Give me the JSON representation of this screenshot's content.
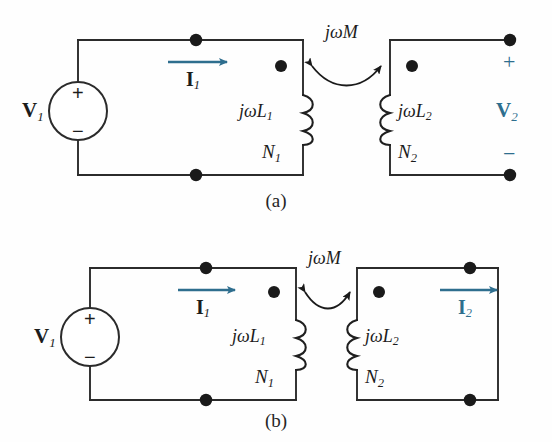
{
  "figure": {
    "colors": {
      "wire": "#2b2b2b",
      "node_dot": "#1a1a1a",
      "text_black": "#1c1c1c",
      "accent_blue": "#2E6E8E"
    },
    "panels": [
      {
        "id": "a",
        "caption": "(a)",
        "source": {
          "name": "V1",
          "label": "V",
          "subscript": "1",
          "plus": "+",
          "minus": "−"
        },
        "primary": {
          "current_label": "I",
          "current_subscript": "1",
          "impedance_label": "jωL",
          "impedance_subscript": "1",
          "turns_label": "N",
          "turns_subscript": "1"
        },
        "coupling": {
          "label": "jωM"
        },
        "secondary": {
          "impedance_label": "jωL",
          "impedance_subscript": "2",
          "turns_label": "N",
          "turns_subscript": "2",
          "voltage_label": "V",
          "voltage_subscript": "2",
          "plus": "+",
          "minus": "−",
          "terminals": "open"
        }
      },
      {
        "id": "b",
        "caption": "(b)",
        "source": {
          "name": "V1",
          "label": "V",
          "subscript": "1",
          "plus": "+",
          "minus": "−"
        },
        "primary": {
          "current_label": "I",
          "current_subscript": "1",
          "impedance_label": "jωL",
          "impedance_subscript": "1",
          "turns_label": "N",
          "turns_subscript": "1"
        },
        "coupling": {
          "label": "jωM"
        },
        "secondary": {
          "impedance_label": "jωL",
          "impedance_subscript": "2",
          "turns_label": "N",
          "turns_subscript": "2",
          "current_label": "I",
          "current_subscript": "2",
          "terminals": "closed"
        }
      }
    ]
  }
}
